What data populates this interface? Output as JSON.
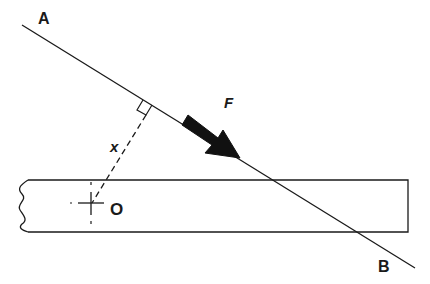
{
  "diagram": {
    "labels": {
      "point_a": "A",
      "point_b": "B",
      "force": "F",
      "distance": "x",
      "origin": "O"
    },
    "colors": {
      "stroke": "#1a1a1a",
      "background": "#ffffff"
    },
    "elements": [
      {
        "type": "line",
        "name": "line-of-action",
        "from": "A",
        "to": "B"
      },
      {
        "type": "arrow",
        "name": "force-arrow",
        "label": "F"
      },
      {
        "type": "dashed-line",
        "name": "perpendicular-distance",
        "label": "x"
      },
      {
        "type": "right-angle-marker",
        "name": "right-angle"
      },
      {
        "type": "beam",
        "name": "beam",
        "left_end": "break-line"
      },
      {
        "type": "crosshair",
        "name": "pivot-point",
        "label": "O"
      }
    ]
  }
}
